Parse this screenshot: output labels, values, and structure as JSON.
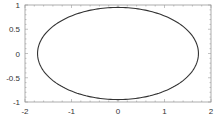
{
  "chart_data": {
    "type": "line",
    "subtype": "parametric",
    "title": "",
    "xlabel": "",
    "ylabel": "",
    "xlim": [
      -2,
      2
    ],
    "ylim": [
      -1,
      1
    ],
    "grid": false,
    "legend": null,
    "x_ticks": [
      -2,
      -1,
      0,
      1,
      2
    ],
    "x_tick_labels": [
      "-2",
      "-1",
      "0",
      "1",
      "2"
    ],
    "y_ticks": [
      -1,
      -0.5,
      0,
      0.5,
      1
    ],
    "y_tick_labels": [
      "-1",
      "-0.5",
      "0",
      "0.5",
      "1"
    ],
    "series": [
      {
        "name": "closed curve",
        "shape": "ellipse (approximate)",
        "center": [
          0,
          0
        ],
        "semi_axis_x": 1.73,
        "semi_axis_y": 0.95,
        "x": [
          1.73,
          1.5,
          0.87,
          0,
          -0.87,
          -1.5,
          -1.73,
          -1.5,
          -0.87,
          0,
          0.87,
          1.5,
          1.73
        ],
        "y": [
          0,
          0.475,
          0.823,
          0.95,
          0.823,
          0.475,
          0,
          -0.475,
          -0.823,
          -0.95,
          -0.823,
          -0.475,
          0
        ],
        "color": "#333333"
      }
    ]
  },
  "style": {
    "frame_color": "#888888",
    "curve_color": "#333333",
    "background": "#ffffff"
  }
}
